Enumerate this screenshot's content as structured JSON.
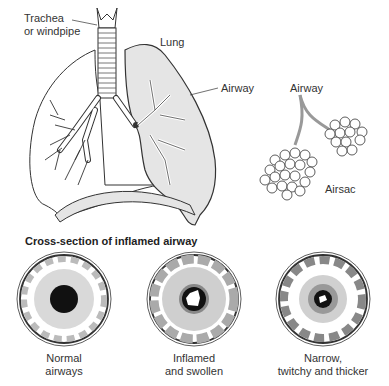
{
  "labels": {
    "trachea_line1": "Trachea",
    "trachea_line2": "or windpipe",
    "lung": "Lung",
    "airway_left": "Airway",
    "airway_right": "Airway",
    "airsac": "Airsac"
  },
  "cross_section": {
    "title": "Cross-section of inflamed airway",
    "panels": [
      {
        "line1": "Normal",
        "line2": "airways"
      },
      {
        "line1": "Inflamed",
        "line2": "and swollen"
      },
      {
        "line1": "Narrow,",
        "line2": "twitchy and thicker"
      }
    ]
  },
  "colors": {
    "outline": "#333333",
    "light_gray": "#d9d9d9",
    "mid_gray": "#bdbdbd",
    "dark_gray": "#808080",
    "lumen": "#111111"
  }
}
